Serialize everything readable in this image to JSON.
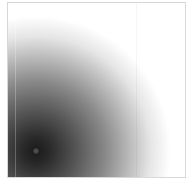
{
  "image": {
    "description": "Grayscale radial gradient with dark spot near bottom-left fading to white",
    "colors": {
      "center": "#1a1a1a",
      "edge": "#ffffff",
      "border": "#d8d8d8",
      "background": "#ffffff"
    },
    "dark_spot_center_px": [
      35,
      150
    ]
  }
}
